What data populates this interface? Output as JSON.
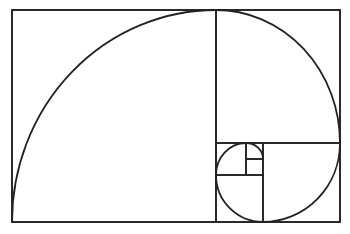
{
  "diagram": {
    "title": "Golden spiral in golden rectangle",
    "stroke_color": "#222222",
    "background": "#ffffff",
    "outer_rect": {
      "x": 12,
      "y": 10,
      "w": 328,
      "h": 212
    },
    "squares": [
      {
        "x": 12,
        "y": 10,
        "w": 204,
        "h": 212
      },
      {
        "x": 216,
        "y": 10,
        "w": 124,
        "h": 133
      },
      {
        "x": 263,
        "y": 143,
        "w": 77,
        "h": 79
      },
      {
        "x": 216,
        "y": 175,
        "w": 47,
        "h": 47
      },
      {
        "x": 216,
        "y": 143,
        "w": 30,
        "h": 32
      },
      {
        "x": 246,
        "y": 143,
        "w": 17,
        "h": 16
      },
      {
        "x": 246,
        "y": 159,
        "w": 17,
        "h": 16
      }
    ],
    "spiral_arcs": [
      {
        "from": [
          12,
          222
        ],
        "to": [
          216,
          10
        ],
        "rx": 204,
        "ry": 212
      },
      {
        "from": [
          216,
          10
        ],
        "to": [
          340,
          143
        ],
        "rx": 124,
        "ry": 133
      },
      {
        "from": [
          340,
          143
        ],
        "to": [
          263,
          222
        ],
        "rx": 77,
        "ry": 79
      },
      {
        "from": [
          263,
          222
        ],
        "to": [
          216,
          175
        ],
        "rx": 47,
        "ry": 47
      },
      {
        "from": [
          216,
          175
        ],
        "to": [
          246,
          143
        ],
        "rx": 30,
        "ry": 32
      },
      {
        "from": [
          246,
          143
        ],
        "to": [
          263,
          159
        ],
        "rx": 17,
        "ry": 16
      }
    ]
  }
}
